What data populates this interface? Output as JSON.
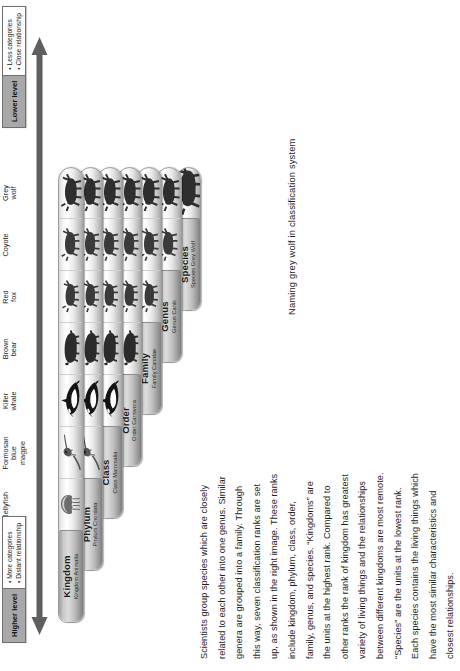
{
  "prose": {
    "lines": [
      "Scientists group species which are closely",
      "related to each other into one genus. Similar",
      "genera are grouped into a family. Through",
      "this way, seven classification ranks are set",
      "up, as shown in the right image. These ranks",
      "include kingdom, phylum, class, order,",
      "family, genus, and species. “Kingdoms” are",
      "the units at the highest rank. Compared to",
      "other ranks the rank of kingdom has greatest",
      "variety of living things and the relationships",
      "between different kingdoms are most remote.",
      "“Species” are the units at the lowest rank.",
      "Each species contains the living things which",
      "have the most similar characteristics and",
      "closest relationships."
    ]
  },
  "caption": "Naming grey wolf in classification system",
  "columns": [
    {
      "key": "jellyfish",
      "label": "Jellyfish",
      "icon": "jellyfish-icon"
    },
    {
      "key": "magpie",
      "label": "Formosan\nblue\nmagpie",
      "icon": "magpie-icon"
    },
    {
      "key": "killer_whale",
      "label": "Killer\nwhale",
      "icon": "killer-whale-icon"
    },
    {
      "key": "brown_bear",
      "label": "Brown\nbear",
      "icon": "brown-bear-icon"
    },
    {
      "key": "red_fox",
      "label": "Red\nfox",
      "icon": "red-fox-icon"
    },
    {
      "key": "coyote",
      "label": "Coyote",
      "icon": "coyote-icon"
    },
    {
      "key": "grey_wolf",
      "label": "Grey\nwolf",
      "icon": "grey-wolf-icon"
    }
  ],
  "ranks": [
    {
      "rank": "Kingdom",
      "scientific": "Kingdom Animalia",
      "members": [
        "jellyfish",
        "magpie",
        "killer_whale",
        "brown_bear",
        "red_fox",
        "coyote",
        "grey_wolf"
      ]
    },
    {
      "rank": "Phylum",
      "scientific": "Phylum Chordata",
      "members": [
        "magpie",
        "killer_whale",
        "brown_bear",
        "red_fox",
        "coyote",
        "grey_wolf"
      ]
    },
    {
      "rank": "Class",
      "scientific": "Class Mammalia",
      "members": [
        "killer_whale",
        "brown_bear",
        "red_fox",
        "coyote",
        "grey_wolf"
      ]
    },
    {
      "rank": "Order",
      "scientific": "Order Carnivora",
      "members": [
        "brown_bear",
        "red_fox",
        "coyote",
        "grey_wolf"
      ]
    },
    {
      "rank": "Family",
      "scientific": "Family Canidae",
      "members": [
        "red_fox",
        "coyote",
        "grey_wolf"
      ]
    },
    {
      "rank": "Genus",
      "scientific": "Genus Canis",
      "members": [
        "coyote",
        "grey_wolf"
      ]
    },
    {
      "rank": "Species",
      "scientific": "Species Grey Wolf",
      "members": [
        "grey_wolf"
      ]
    }
  ],
  "callouts": {
    "higher": {
      "title": "Higher level",
      "bullets": [
        "• More categories",
        "• Distant relationship"
      ]
    },
    "lower": {
      "title": "Lower level",
      "bullets": [
        "• Less categories",
        "• Close relationship"
      ]
    }
  },
  "colors": {
    "bar_light": "#f1f1f1",
    "bar_dark": "#a3a3a3",
    "capsule": "#b5b5b5",
    "arrow": "#5f5f5f",
    "callout_title_bg": "#a8a8a8",
    "text": "#1d1d1d"
  }
}
